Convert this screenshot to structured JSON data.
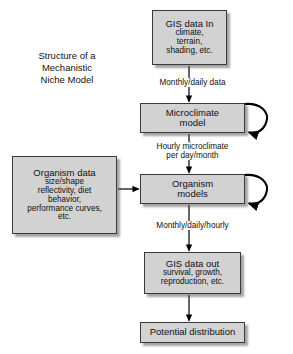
{
  "diagram": {
    "title": {
      "lines": [
        "Structure of a",
        "Mechanistic",
        "Niche Model"
      ]
    },
    "nodes": {
      "gis_in": {
        "head": "GIS data In",
        "sub": [
          "climate,",
          "terrain,",
          "shading, etc."
        ]
      },
      "microclimate": {
        "head": "Microclimate",
        "sub": [
          "model"
        ]
      },
      "organism_data": {
        "head": "Organism data",
        "sub": [
          "size/shape",
          "reflectivity, diet",
          "behavior,",
          "performance curves,",
          "etc."
        ]
      },
      "organism_models": {
        "head": "Organism",
        "sub": [
          "models"
        ]
      },
      "gis_out": {
        "head": "GIS data out",
        "sub": [
          "survival, growth,",
          "reproduction, etc."
        ]
      },
      "potential": {
        "head": "Potential distribution",
        "sub": []
      }
    },
    "edge_labels": {
      "gis_in_to_microclimate": [
        "Monthly/daily data"
      ],
      "microclimate_to_organism": [
        "Hourly microclimate",
        "per day/month"
      ],
      "organism_to_gis_out": [
        "Monthly/daily/hourly"
      ]
    },
    "colors": {
      "box_fill": "#d2d2d2",
      "box_border": "#3a3a3a",
      "arrow": "#000000",
      "background": "#ffffff",
      "text": "#111111"
    }
  }
}
